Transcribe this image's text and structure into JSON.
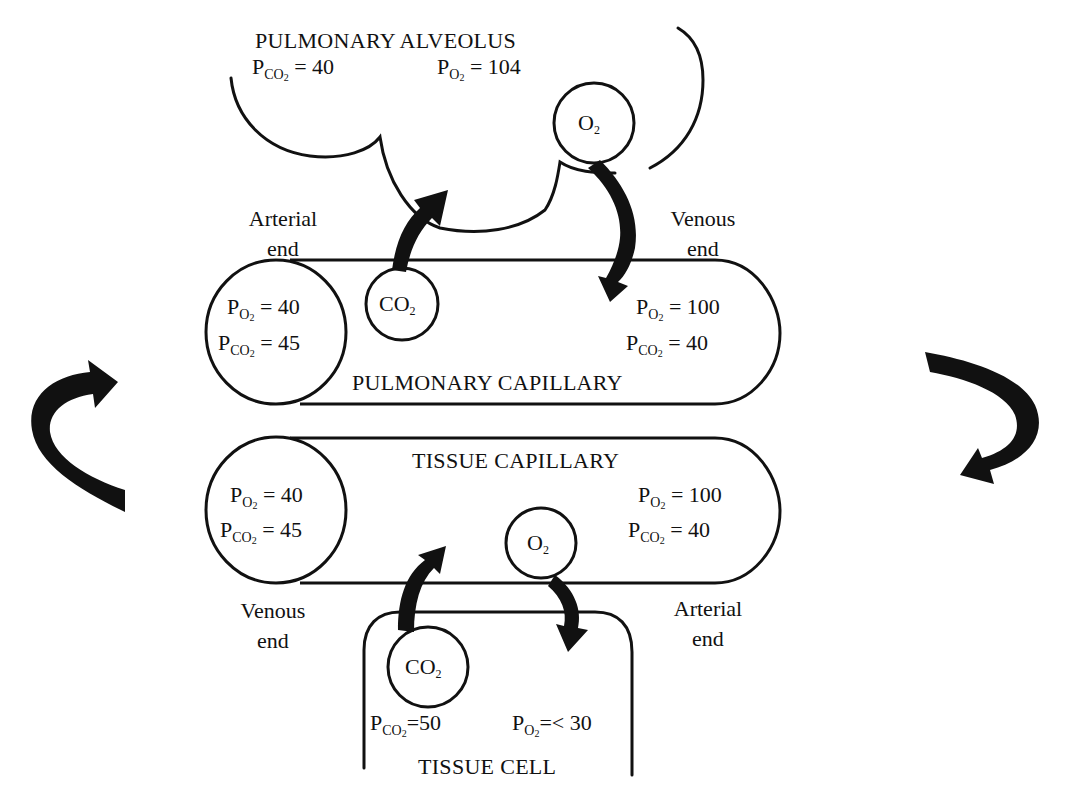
{
  "alveolus": {
    "title": "PULMONARY ALVEOLUS",
    "pco2": {
      "sym": "P",
      "sub": "CO",
      "subsub": "2",
      "eq": "= 40"
    },
    "po2": {
      "sym": "P",
      "sub": "O",
      "subsub": "2",
      "eq": "= 104"
    },
    "o2_bubble": {
      "base": "O",
      "sub": "2"
    }
  },
  "pulmonary_capillary": {
    "title": "PULMONARY CAPILLARY",
    "left_end_label": [
      "Arterial",
      "end"
    ],
    "right_end_label": [
      "Venous",
      "end"
    ],
    "left_values": [
      {
        "sym": "P",
        "sub": "O",
        "subsub": "2",
        "eq": "= 40"
      },
      {
        "sym": "P",
        "sub": "CO",
        "subsub": "2",
        "eq": "= 45"
      }
    ],
    "right_values": [
      {
        "sym": "P",
        "sub": "O",
        "subsub": "2",
        "eq": "= 100"
      },
      {
        "sym": "P",
        "sub": "CO",
        "subsub": "2",
        "eq": "= 40"
      }
    ],
    "co2_bubble": {
      "base": "CO",
      "sub": "2"
    }
  },
  "tissue_capillary": {
    "title": "TISSUE CAPILLARY",
    "left_end_label": [
      "Venous",
      "end"
    ],
    "right_end_label": [
      "Arterial",
      "end"
    ],
    "left_values": [
      {
        "sym": "P",
        "sub": "O",
        "subsub": "2",
        "eq": "= 40"
      },
      {
        "sym": "P",
        "sub": "CO",
        "subsub": "2",
        "eq": "= 45"
      }
    ],
    "right_values": [
      {
        "sym": "P",
        "sub": "O",
        "subsub": "2",
        "eq": "= 100"
      },
      {
        "sym": "P",
        "sub": "CO",
        "subsub": "2",
        "eq": "= 40"
      }
    ],
    "o2_bubble": {
      "base": "O",
      "sub": "2"
    }
  },
  "tissue_cell": {
    "title": "TISSUE CELL",
    "pco2": {
      "sym": "P",
      "sub": "CO",
      "subsub": "2",
      "eq": "=50"
    },
    "po2": {
      "sym": "P",
      "sub": "O",
      "subsub": "2",
      "eq": "=< 30"
    },
    "co2_bubble": {
      "base": "CO",
      "sub": "2"
    }
  },
  "circulation_arrows": {
    "left": "up-right-curved-arrow",
    "right": "down-left-curved-arrow"
  }
}
